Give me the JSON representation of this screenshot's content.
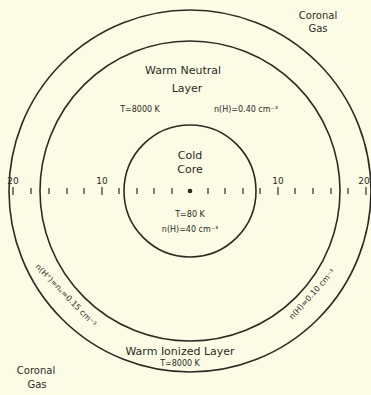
{
  "colors": {
    "background": "#fcfce6",
    "ink": "#2b2b24"
  },
  "regions": {
    "coronal_top": {
      "line1": "Coronal",
      "line2": "Gas"
    },
    "coronal_bottom": {
      "line1": "Coronal",
      "line2": "Gas"
    },
    "warm_neutral": {
      "line1": "Warm Neutral",
      "line2": "Layer",
      "temperature": "T=8000 K",
      "density": "n(H)=0.40 cm⁻³"
    },
    "cold_core": {
      "line1": "Cold",
      "line2": "Core",
      "temperature": "T=80 K",
      "density": "n(H)=40 cm⁻³"
    },
    "warm_ionized": {
      "title": "Warm Ionized Layer",
      "temperature": "T=8000 K",
      "density_left": "n(H⁺)=nₑ=0.15 cm⁻³",
      "density_right": "n(H)=0.10 cm⁻³"
    }
  },
  "scale": {
    "labels": {
      "left_20": "20",
      "left_10": "10",
      "right_10": "10",
      "right_20": "20"
    },
    "tick_step": 2,
    "range": [
      -20,
      20
    ]
  }
}
